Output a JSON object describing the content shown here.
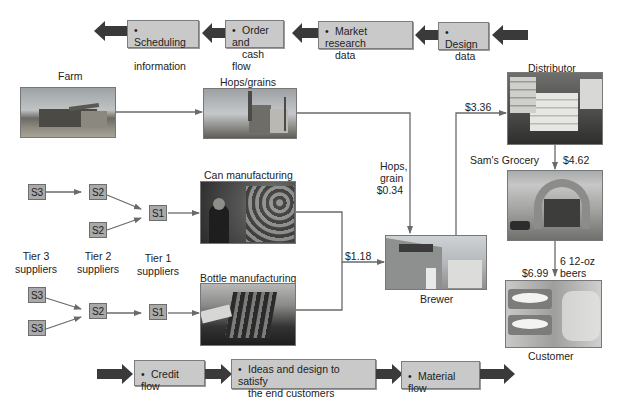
{
  "top_flow": {
    "direction": "right-to-left",
    "items": [
      {
        "label": "Scheduling information",
        "line1": "Scheduling",
        "line2": "information"
      },
      {
        "label": "Order and cash flow",
        "line1": "Order and",
        "line2": "cash flow"
      },
      {
        "label": "Market research data",
        "line1": "Market research",
        "line2": "data"
      },
      {
        "label": "Design data",
        "line1": "Design",
        "line2": "data"
      }
    ],
    "bullet": "•"
  },
  "bottom_flow": {
    "direction": "left-to-right",
    "items": [
      {
        "label": "Credit flow",
        "line1": "Credit flow",
        "line2": ""
      },
      {
        "label": "Ideas and design to satisfy the end customers",
        "line1": "Ideas and design to satisfy",
        "line2": "the end customers"
      },
      {
        "label": "Material flow",
        "line1": "Material flow",
        "line2": ""
      }
    ],
    "bullet": "•"
  },
  "nodes": {
    "farm": {
      "label": "Farm",
      "image": "farm-combine-harvester-photo"
    },
    "hops": {
      "label": "Hops/grains",
      "image": "grain-silo-photo"
    },
    "can": {
      "label": "Can manufacturing",
      "image": "can-factory-photo"
    },
    "bottle": {
      "label": "Bottle manufacturing",
      "image": "bottle-line-photo"
    },
    "brewer": {
      "label": "Brewer",
      "image": "brewery-building-photo"
    },
    "distributor": {
      "label": "Distributor",
      "image": "pallet-warehouse-photo"
    },
    "grocery": {
      "label": "Sam's Grocery",
      "image": "grocery-store-photo"
    },
    "customer": {
      "label": "Customer",
      "image": "beer-shelf-photo"
    }
  },
  "prices": {
    "hops_line1": "Hops,",
    "hops_line2": "grain",
    "hops_price": "$0.34",
    "packaging": "$1.18",
    "distributor": "$3.36",
    "grocery": "$4.62",
    "customer": "$6.99",
    "unit_line1": "6 12-oz",
    "unit_line2": "beers"
  },
  "suppliers": {
    "can_chain": [
      {
        "id": "S3"
      },
      {
        "id": "S2"
      },
      {
        "id": "S2"
      },
      {
        "id": "S1"
      }
    ],
    "bottle_chain": [
      {
        "id": "S3"
      },
      {
        "id": "S3"
      },
      {
        "id": "S2"
      },
      {
        "id": "S1"
      }
    ],
    "tiers": [
      {
        "line1": "Tier 3",
        "line2": "suppliers"
      },
      {
        "line1": "Tier 2",
        "line2": "suppliers"
      },
      {
        "line1": "Tier 1",
        "line2": "suppliers"
      }
    ]
  },
  "colors": {
    "flow_box_fill": "#c9c9c9",
    "flow_arrow": "#3a3a3a",
    "supplier_box": "#a9a9a9",
    "connector_line": "#6a6a6a"
  }
}
